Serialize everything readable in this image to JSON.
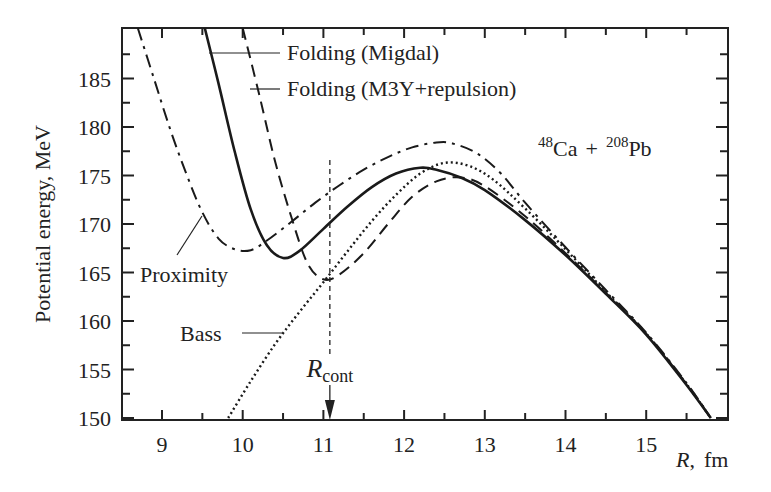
{
  "chart_data": {
    "type": "line",
    "title": "",
    "xlabel": "R,  fm",
    "xlabel_var": "R",
    "xlabel_unit": "fm",
    "ylabel": "Potential energy, MeV",
    "xlim": [
      8.5,
      16.0
    ],
    "ylim": [
      149.8,
      190.2
    ],
    "xticks": [
      9,
      10,
      11,
      12,
      13,
      14,
      15
    ],
    "xminor_ticks": [
      9.5,
      10.5,
      11.5,
      12.5,
      13.5,
      14.5,
      15.5
    ],
    "yticks": [
      150,
      155,
      160,
      165,
      170,
      175,
      180,
      185
    ],
    "yminor_ticks": [
      152.5,
      157.5,
      162.5,
      167.5,
      172.5,
      177.5,
      182.5,
      187.5
    ],
    "grid": false,
    "annotation_reaction": {
      "a1": "48",
      "e1": "Ca",
      "op": "+",
      "a2": "208",
      "e2": "Pb"
    },
    "r_cont": {
      "label_main": "R",
      "label_sub": "cont",
      "x": 11.08
    },
    "series": [
      {
        "name": "Folding (Migdal)",
        "style": "solid",
        "x": [
          9.53,
          9.7,
          9.9,
          10.1,
          10.3,
          10.5,
          10.7,
          11.0,
          11.3,
          11.6,
          11.9,
          12.2,
          12.4,
          12.7,
          13.0,
          13.5,
          14.0,
          14.5,
          15.0,
          15.5,
          15.8
        ],
        "y": [
          190.2,
          184.5,
          177.5,
          171.5,
          167.8,
          166.5,
          167.2,
          169.5,
          171.8,
          173.8,
          175.2,
          175.8,
          175.6,
          174.8,
          173.5,
          170.4,
          166.8,
          162.8,
          158.6,
          153.4,
          150.0
        ]
      },
      {
        "name": "Folding (M3Y+repulsion)",
        "style": "dashed",
        "x": [
          10.0,
          10.2,
          10.4,
          10.6,
          10.8,
          11.0,
          11.2,
          11.5,
          11.8,
          12.1,
          12.4,
          12.7,
          13.0,
          13.5,
          14.0,
          14.5,
          15.0,
          15.5,
          15.8
        ],
        "y": [
          190.2,
          183.5,
          176.5,
          170.8,
          166.0,
          164.3,
          164.8,
          167.0,
          170.0,
          172.8,
          174.4,
          174.8,
          173.9,
          170.8,
          167.0,
          162.9,
          158.7,
          153.5,
          150.0
        ]
      },
      {
        "name": "Proximity",
        "style": "dashdot",
        "x": [
          8.7,
          8.9,
          9.1,
          9.3,
          9.5,
          9.7,
          9.9,
          10.1,
          10.3,
          10.6,
          10.9,
          11.2,
          11.5,
          11.8,
          12.1,
          12.4,
          12.6,
          12.9,
          13.2,
          13.5,
          14.0,
          14.5,
          15.0,
          15.5,
          15.8
        ],
        "y": [
          190.2,
          185.0,
          179.8,
          175.2,
          171.2,
          168.5,
          167.4,
          167.3,
          168.3,
          170.2,
          172.2,
          174.0,
          175.6,
          176.9,
          177.9,
          178.4,
          178.3,
          177.3,
          175.2,
          172.2,
          167.6,
          163.2,
          158.8,
          153.6,
          150.0
        ]
      },
      {
        "name": "Bass",
        "style": "dotted",
        "x": [
          9.82,
          10.1,
          10.4,
          10.7,
          11.0,
          11.3,
          11.6,
          11.9,
          12.2,
          12.5,
          12.8,
          13.1,
          13.5,
          14.0,
          14.5,
          15.0,
          15.5,
          15.8
        ],
        "y": [
          150.0,
          153.8,
          157.6,
          160.9,
          164.0,
          167.2,
          170.3,
          173.0,
          175.2,
          176.3,
          176.0,
          174.6,
          171.6,
          167.4,
          163.0,
          158.7,
          153.5,
          150.0
        ]
      }
    ],
    "legend": [
      {
        "label": "Folding (Migdal)",
        "style": "solid"
      },
      {
        "label": "Folding (M3Y+repulsion)",
        "style": "dashed"
      },
      {
        "label": "Proximity",
        "style": "dashdot"
      },
      {
        "label": "Bass",
        "style": "dotted"
      }
    ]
  },
  "colors": {
    "line": "#1a1a1a",
    "axis": "#222222",
    "background": "#ffffff"
  }
}
